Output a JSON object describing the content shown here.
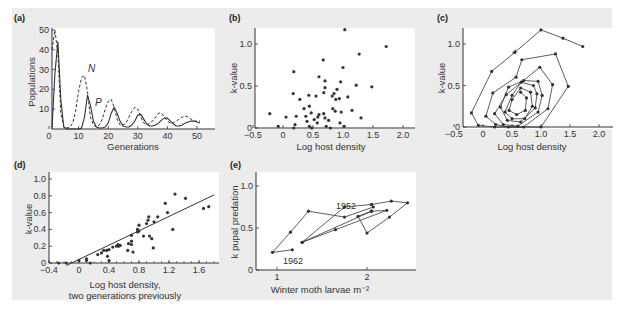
{
  "figure": {
    "background": "#ececec",
    "plot_background": "#ffffff",
    "ink_color": "#333333"
  },
  "chart_data": [
    {
      "panel": "(a)",
      "type": "line",
      "title": "",
      "xlabel": "Generations",
      "ylabel": "Populations",
      "xlim": [
        0,
        57
      ],
      "ylim": [
        0,
        50
      ],
      "xticks": [
        "0",
        "10",
        "20",
        "30",
        "40",
        "50"
      ],
      "yticks": [
        "10",
        "20",
        "30",
        "40",
        "50"
      ],
      "grid": false,
      "annotations": [
        "N",
        "P"
      ],
      "series": [
        {
          "name": "N",
          "style": "dashed",
          "x": [
            1,
            2,
            3,
            4,
            5,
            6,
            7,
            8,
            9,
            10,
            11,
            12,
            13,
            14,
            15,
            16,
            17,
            18,
            19,
            20,
            21,
            22,
            23,
            24,
            25,
            26,
            27,
            28,
            29,
            30,
            31,
            32,
            33,
            34,
            35,
            36,
            37,
            38,
            39,
            40,
            41,
            42,
            43,
            44,
            45,
            46,
            47,
            48,
            49,
            50,
            51
          ],
          "values": [
            40,
            50,
            38,
            8,
            1,
            0.5,
            1,
            3,
            9,
            19,
            26,
            27,
            19,
            6,
            2,
            1,
            2,
            5,
            10,
            14,
            15,
            11,
            5,
            2,
            2,
            3,
            6,
            9,
            11,
            10,
            6,
            3,
            2,
            3,
            4,
            6,
            8,
            8,
            6,
            4,
            3,
            3,
            4,
            5,
            6,
            6.5,
            6,
            5,
            4,
            4,
            4
          ]
        },
        {
          "name": "P",
          "style": "solid",
          "x": [
            1,
            2,
            3,
            4,
            5,
            6,
            7,
            8,
            9,
            10,
            11,
            12,
            13,
            14,
            15,
            16,
            17,
            18,
            19,
            20,
            21,
            22,
            23,
            24,
            25,
            26,
            27,
            28,
            29,
            30,
            31,
            32,
            33,
            34,
            35,
            36,
            37,
            38,
            39,
            40,
            41,
            42,
            43,
            44,
            45,
            46,
            47,
            48,
            49,
            50,
            51
          ],
          "values": [
            0,
            28,
            44,
            15,
            1,
            0,
            0,
            0,
            0,
            0,
            0.5,
            6,
            17,
            12,
            4,
            1,
            0.5,
            0.5,
            1,
            3,
            8,
            11,
            8,
            4,
            1.5,
            1,
            1,
            2,
            4,
            7,
            7.5,
            5,
            2.5,
            1.5,
            1.5,
            2,
            3,
            4.5,
            5.5,
            5.5,
            4,
            2.5,
            1.5,
            1.5,
            2,
            3,
            3.5,
            4,
            4,
            3.5,
            3
          ]
        }
      ]
    },
    {
      "panel": "(b)",
      "type": "scatter",
      "title": "",
      "xlabel": "Log host density",
      "ylabel": "k-value",
      "xlim": [
        -0.55,
        2.3
      ],
      "ylim": [
        0,
        1.2
      ],
      "xticks": [
        "-0.5",
        "0",
        "0.5",
        "1.0",
        "1.5",
        "2.0"
      ],
      "yticks": [
        "0",
        "0.5",
        "1.0"
      ],
      "grid": false,
      "points": [
        [
          -0.22,
          0.17
        ],
        [
          -0.08,
          0.02
        ],
        [
          0.05,
          0.13
        ],
        [
          0.18,
          0.67
        ],
        [
          0.17,
          0.41
        ],
        [
          0.2,
          0.04
        ],
        [
          0.18,
          0.0
        ],
        [
          0.22,
          0.14
        ],
        [
          0.28,
          0.34
        ],
        [
          0.35,
          0.23
        ],
        [
          0.38,
          0.14
        ],
        [
          0.4,
          0.08
        ],
        [
          0.43,
          0.39
        ],
        [
          0.44,
          0.26
        ],
        [
          0.44,
          0.02
        ],
        [
          0.47,
          0.18
        ],
        [
          0.48,
          0.0
        ],
        [
          0.52,
          0.1
        ],
        [
          0.55,
          0.38
        ],
        [
          0.57,
          0.06
        ],
        [
          0.58,
          0.13
        ],
        [
          0.6,
          0.16
        ],
        [
          0.6,
          0.61
        ],
        [
          0.67,
          0.81
        ],
        [
          0.68,
          0.42
        ],
        [
          0.7,
          0.48
        ],
        [
          0.7,
          0.56
        ],
        [
          0.68,
          0.17
        ],
        [
          0.7,
          0.12
        ],
        [
          0.72,
          0.02
        ],
        [
          0.76,
          0.09
        ],
        [
          0.79,
          0.0
        ],
        [
          0.82,
          0.38
        ],
        [
          0.83,
          0.23
        ],
        [
          0.85,
          0.41
        ],
        [
          0.87,
          0.2
        ],
        [
          0.88,
          0.34
        ],
        [
          0.9,
          0.46
        ],
        [
          0.94,
          0.35
        ],
        [
          0.95,
          0.06
        ],
        [
          0.96,
          0.55
        ],
        [
          0.97,
          0.19
        ],
        [
          1.0,
          0.72
        ],
        [
          1.02,
          0.02
        ],
        [
          1.03,
          1.17
        ],
        [
          1.08,
          0.37
        ],
        [
          1.15,
          0.21
        ],
        [
          1.22,
          0.51
        ],
        [
          1.27,
          0.88
        ],
        [
          1.3,
          0.12
        ],
        [
          1.48,
          0.49
        ],
        [
          1.72,
          0.97
        ]
      ]
    },
    {
      "panel": "(c)",
      "type": "line",
      "title": "",
      "xlabel": "Log host density",
      "ylabel": "k-value",
      "xlim": [
        -0.55,
        2.3
      ],
      "ylim": [
        0,
        1.2
      ],
      "xticks": [
        "-0.5",
        "0",
        "0.5",
        "1.0",
        "1.5",
        "2.0"
      ],
      "yticks": [
        "0",
        "0.5",
        "1.0"
      ],
      "grid": false,
      "description": "Inward-spiralling trajectory of k-value vs log host density (clockwise), converging toward ~(0.6, 0.25)",
      "series": [
        {
          "name": "trajectory",
          "points": [
            [
              1.72,
              0.97
            ],
            [
              1.38,
              1.07
            ],
            [
              1.0,
              1.17
            ],
            [
              0.55,
              0.9
            ],
            [
              0.15,
              0.67
            ],
            [
              -0.2,
              0.17
            ],
            [
              -0.08,
              0.02
            ],
            [
              0.2,
              0.0
            ],
            [
              1.0,
              0.0
            ],
            [
              1.47,
              0.49
            ],
            [
              1.25,
              0.88
            ],
            [
              0.67,
              0.81
            ],
            [
              0.57,
              0.6
            ],
            [
              0.17,
              0.41
            ],
            [
              0.05,
              0.13
            ],
            [
              0.22,
              0.03
            ],
            [
              0.44,
              0.0
            ],
            [
              0.7,
              0.0
            ],
            [
              1.12,
              0.22
            ],
            [
              1.2,
              0.51
            ],
            [
              0.98,
              0.72
            ],
            [
              0.4,
              0.39
            ],
            [
              0.2,
              0.16
            ],
            [
              0.35,
              0.03
            ],
            [
              0.6,
              0.01
            ],
            [
              0.95,
              0.18
            ],
            [
              1.02,
              0.38
            ],
            [
              0.95,
              0.55
            ],
            [
              0.7,
              0.56
            ],
            [
              0.44,
              0.48
            ],
            [
              0.3,
              0.24
            ],
            [
              0.42,
              0.08
            ],
            [
              0.65,
              0.06
            ],
            [
              0.9,
              0.23
            ],
            [
              0.93,
              0.4
            ],
            [
              0.87,
              0.5
            ],
            [
              0.66,
              0.54
            ],
            [
              0.5,
              0.38
            ],
            [
              0.38,
              0.18
            ],
            [
              0.5,
              0.1
            ],
            [
              0.72,
              0.1
            ],
            [
              0.85,
              0.25
            ],
            [
              0.82,
              0.42
            ],
            [
              0.65,
              0.47
            ],
            [
              0.5,
              0.33
            ],
            [
              0.45,
              0.2
            ],
            [
              0.58,
              0.15
            ],
            [
              0.73,
              0.2
            ],
            [
              0.75,
              0.35
            ],
            [
              0.65,
              0.42
            ]
          ]
        }
      ]
    },
    {
      "panel": "(d)",
      "type": "scatter",
      "title": "",
      "xlabel": "Log host density, two generations previously",
      "ylabel": "k-value",
      "xlim": [
        -0.4,
        1.8
      ],
      "ylim": [
        0,
        1.0
      ],
      "xticks": [
        "-0.4",
        "0",
        "0.4",
        "0.8",
        "1.2",
        "1.6"
      ],
      "yticks": [
        "0",
        "0.2",
        "0.4",
        "0.6",
        "0.8",
        "1.0"
      ],
      "grid": false,
      "regression_line": {
        "x": [
          -0.17,
          1.8
        ],
        "y": [
          -0.03,
          0.81
        ]
      },
      "points": [
        [
          -0.27,
          0.0
        ],
        [
          -0.17,
          0.0
        ],
        [
          0.0,
          0.03
        ],
        [
          0.1,
          0.05
        ],
        [
          0.1,
          0.03
        ],
        [
          0.15,
          0.0
        ],
        [
          0.25,
          0.1
        ],
        [
          0.3,
          0.12
        ],
        [
          0.33,
          0.15
        ],
        [
          0.37,
          0.15
        ],
        [
          0.38,
          0.08
        ],
        [
          0.4,
          0.03
        ],
        [
          0.4,
          0.16
        ],
        [
          0.45,
          0.19
        ],
        [
          0.5,
          0.2
        ],
        [
          0.52,
          0.22
        ],
        [
          0.53,
          0.2
        ],
        [
          0.55,
          0.21
        ],
        [
          0.65,
          0.15
        ],
        [
          0.66,
          0.23
        ],
        [
          0.7,
          0.22
        ],
        [
          0.7,
          0.26
        ],
        [
          0.72,
          0.13
        ],
        [
          0.7,
          0.33
        ],
        [
          0.78,
          0.4
        ],
        [
          0.78,
          0.37
        ],
        [
          0.8,
          0.38
        ],
        [
          0.8,
          0.45
        ],
        [
          0.86,
          0.32
        ],
        [
          0.9,
          0.47
        ],
        [
          0.92,
          0.51
        ],
        [
          0.93,
          0.55
        ],
        [
          0.94,
          0.32
        ],
        [
          0.97,
          0.29
        ],
        [
          0.99,
          0.18
        ],
        [
          1.0,
          0.49
        ],
        [
          1.05,
          0.55
        ],
        [
          1.15,
          0.71
        ],
        [
          1.18,
          0.6
        ],
        [
          1.25,
          0.4
        ],
        [
          1.28,
          0.82
        ],
        [
          1.42,
          0.77
        ],
        [
          1.66,
          0.65
        ],
        [
          1.73,
          0.67
        ]
      ]
    },
    {
      "panel": "(e)",
      "type": "line",
      "title": "",
      "xlabel": "Winter moth larvae m⁻²",
      "ylabel": "k pupal predation",
      "xlim": [
        0.8,
        2.6
      ],
      "ylim": [
        0,
        1.2
      ],
      "xticks": [
        "1",
        "2"
      ],
      "yticks": [
        "0",
        "0.5",
        "1.0"
      ],
      "grid": false,
      "annotations": [
        "1952",
        "1962"
      ],
      "series": [
        {
          "name": "1952-1962 trajectory",
          "points": [
            [
              1.75,
              0.75
            ],
            [
              2.05,
              0.78
            ],
            [
              2.07,
              0.75
            ],
            [
              1.75,
              0.63
            ],
            [
              1.35,
              0.7
            ],
            [
              1.15,
              0.45
            ],
            [
              0.95,
              0.21
            ],
            [
              1.17,
              0.24
            ]
          ],
          "extra_segments": [
            [
              [
                1.75,
                0.75
              ],
              [
                1.28,
                0.33
              ],
              [
                2.05,
                0.7
              ],
              [
                2.22,
                0.71
              ],
              [
                1.65,
                0.48
              ],
              [
                1.28,
                0.33
              ]
            ],
            [
              [
                2.05,
                0.78
              ],
              [
                2.27,
                0.82
              ],
              [
                2.45,
                0.8
              ],
              [
                2.25,
                0.63
              ],
              [
                2.0,
                0.44
              ],
              [
                1.9,
                0.64
              ],
              [
                2.05,
                0.7
              ]
            ]
          ]
        }
      ]
    }
  ],
  "labels": {
    "a": {
      "panel": "(a)",
      "xlabel": "Generations",
      "ylabel": "Populations",
      "N": "N",
      "P": "P",
      "xticks": [
        "0",
        "10",
        "20",
        "30",
        "40",
        "50"
      ],
      "yticks": [
        "10",
        "20",
        "30",
        "40",
        "50"
      ]
    },
    "b": {
      "panel": "(b)",
      "xlabel": "Log host density",
      "ylabel": "k-value",
      "xticks": [
        "−0.5",
        "0",
        "0.5",
        "1.0",
        "1.5",
        "2.0"
      ],
      "yticks": [
        "0",
        "0.5",
        "1.0"
      ]
    },
    "c": {
      "panel": "(c)",
      "xlabel": "Log host density",
      "ylabel": "k-value",
      "xticks": [
        "−0.5",
        "0",
        "0.5",
        "1.0",
        "1.5",
        "2.0"
      ],
      "yticks": [
        "0",
        "0.5",
        "1.0"
      ]
    },
    "d": {
      "panel": "(d)",
      "xlabel1": "Log host density,",
      "xlabel2": "two generations previously",
      "ylabel": "k-value",
      "xticks": [
        "−0.4",
        "0",
        "0.4",
        "0.8",
        "1.2",
        "1.6"
      ],
      "yticks": [
        "0",
        "0.2",
        "0.4",
        "0.6",
        "0.8",
        "1.0"
      ]
    },
    "e": {
      "panel": "(e)",
      "xlabel": "Winter moth larvae m⁻²",
      "ylabel": "k pupal predation",
      "xticks": [
        "1",
        "2"
      ],
      "yticks": [
        "0",
        "0.5",
        "1.0"
      ],
      "year_start": "1952",
      "year_end": "1962"
    }
  }
}
